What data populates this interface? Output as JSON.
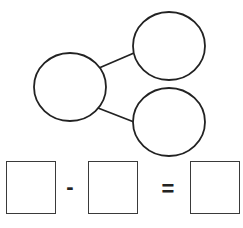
{
  "diagram": {
    "type": "number-bond-subtraction",
    "stroke_color": "#222222",
    "background": "#ffffff",
    "bond": {
      "whole": {
        "label": "",
        "cx": 70,
        "cy": 87,
        "rx": 36,
        "ry": 34
      },
      "parts": [
        {
          "label": "",
          "cx": 169,
          "cy": 46,
          "rx": 36,
          "ry": 34
        },
        {
          "label": "",
          "cx": 169,
          "cy": 122,
          "rx": 36,
          "ry": 34
        }
      ]
    },
    "equation": {
      "boxes": [
        {
          "value": ""
        },
        {
          "value": ""
        },
        {
          "value": ""
        }
      ],
      "operator": "-",
      "equals": "="
    }
  }
}
